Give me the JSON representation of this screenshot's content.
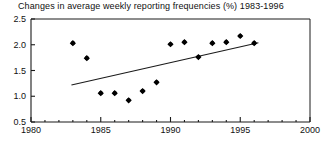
{
  "chart_data": {
    "type": "scatter",
    "title": "Changes in average weekly reporting frequencies (%) 1983-1996",
    "xlabel": "",
    "ylabel": "",
    "xlim": [
      1980,
      2000
    ],
    "ylim": [
      0.5,
      2.5
    ],
    "x_ticks": [
      1980,
      1985,
      1990,
      1995,
      2000
    ],
    "x_tick_labels": [
      "1980",
      "1985",
      "1990",
      "1995",
      "2000"
    ],
    "y_ticks": [
      0.5,
      1.0,
      1.5,
      2.0,
      2.5
    ],
    "y_tick_labels": [
      "0.5",
      "1.0",
      "1.5",
      "2.0",
      "2.5"
    ],
    "x_minor_step": 1,
    "grid": false,
    "legend": null,
    "x": [
      1983,
      1984,
      1985,
      1986,
      1987,
      1988,
      1989,
      1990,
      1991,
      1992,
      1993,
      1994,
      1995,
      1996
    ],
    "values": [
      2.03,
      1.74,
      1.06,
      1.06,
      0.92,
      1.1,
      1.27,
      2.01,
      2.05,
      1.76,
      2.03,
      2.05,
      2.17,
      2.03
    ],
    "series": [
      {
        "name": "reporting frequency change",
        "marker": "diamond",
        "color": "#000000",
        "points": [
          {
            "x": 1983,
            "y": 2.03
          },
          {
            "x": 1984,
            "y": 1.74
          },
          {
            "x": 1985,
            "y": 1.06
          },
          {
            "x": 1986,
            "y": 1.06
          },
          {
            "x": 1987,
            "y": 0.92
          },
          {
            "x": 1988,
            "y": 1.1
          },
          {
            "x": 1989,
            "y": 1.27
          },
          {
            "x": 1990,
            "y": 2.01
          },
          {
            "x": 1991,
            "y": 2.05
          },
          {
            "x": 1992,
            "y": 1.76
          },
          {
            "x": 1993,
            "y": 2.03
          },
          {
            "x": 1994,
            "y": 2.05
          },
          {
            "x": 1995,
            "y": 2.17
          },
          {
            "x": 1996,
            "y": 2.03
          }
        ]
      }
    ],
    "trend_line": {
      "name": "linear trend",
      "color": "#1a1a1a",
      "x_start": 1982.9,
      "y_start": 1.22,
      "x_end": 1996.3,
      "y_end": 2.04
    },
    "annotations": []
  },
  "style": {
    "axis_color": "#1a1a1a",
    "marker_color": "#000000",
    "background": "#ffffff"
  }
}
